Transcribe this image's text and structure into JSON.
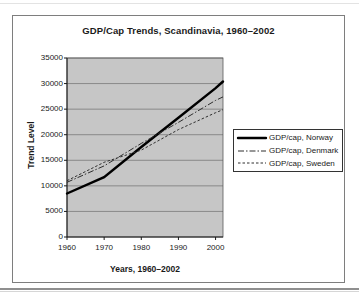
{
  "chart": {
    "title": "GDP/Cap Trends, Scandinavia, 1960–2002",
    "ylabel": "Trend Level",
    "xlabel": "Years, 1960–2002"
  },
  "chart_data": {
    "type": "line",
    "title": "GDP/Cap Trends, Scandinavia, 1960–2002",
    "xlabel": "Years, 1960–2002",
    "ylabel": "Trend Level",
    "xlim": [
      1960,
      2002
    ],
    "ylim": [
      0,
      35000
    ],
    "x_ticks": [
      1960,
      1970,
      1980,
      1990,
      2000
    ],
    "y_ticks": [
      0,
      5000,
      10000,
      15000,
      20000,
      25000,
      30000,
      35000
    ],
    "grid": true,
    "plot_bg": "#c6c6c6",
    "legend_position": "right",
    "x": [
      1960,
      1970,
      1980,
      1990,
      2000,
      2002
    ],
    "series": [
      {
        "name": "GDP/cap, Norway",
        "style": "solid-thick",
        "color": "#000000",
        "values": [
          8500,
          11700,
          17600,
          23300,
          29100,
          30400
        ]
      },
      {
        "name": "GDP/cap, Denmark",
        "style": "dash-dot",
        "color": "#2e2e2e",
        "values": [
          10700,
          13900,
          18300,
          22400,
          26700,
          27400
        ]
      },
      {
        "name": "GDP/cap, Sweden",
        "style": "dashed",
        "color": "#2e2e2e",
        "values": [
          11000,
          14600,
          17000,
          21000,
          24300,
          24900
        ]
      }
    ]
  }
}
